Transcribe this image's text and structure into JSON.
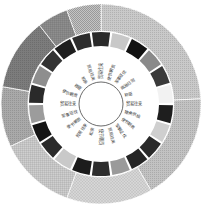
{
  "diagram": {
    "type": "circular-sunburst",
    "center": [
      101,
      104
    ],
    "radii": {
      "inner_circle": 22,
      "label_ring_outer": 56,
      "middle_ring_inner": 58,
      "middle_ring_outer": 72,
      "outer_ring_inner": 73,
      "outer_ring_outer": 100
    },
    "outer_ring": [
      {
        "start": -90,
        "end": -3,
        "fill": "#c9c9c9",
        "pattern": "dots"
      },
      {
        "start": -3,
        "end": 60,
        "fill": "#c2c2c2",
        "pattern": "dots"
      },
      {
        "start": 60,
        "end": 110,
        "fill": "#d6d6d6",
        "pattern": "cross"
      },
      {
        "start": 110,
        "end": 155,
        "fill": "#cfcfcf",
        "pattern": "grid"
      },
      {
        "start": 155,
        "end": 190,
        "fill": "#a9a9a9",
        "pattern": "dots"
      },
      {
        "start": 190,
        "end": 232,
        "fill": "#7c7c7c",
        "pattern": "dots"
      },
      {
        "start": 232,
        "end": 250,
        "fill": "#8e8e8e",
        "pattern": "grid"
      },
      {
        "start": 250,
        "end": 270,
        "fill": "#c4c4c4",
        "pattern": "checker"
      }
    ],
    "middle_ring": [
      {
        "fill": "#2a2a2a"
      },
      {
        "fill": "#c8c8c8"
      },
      {
        "fill": "#111111"
      },
      {
        "fill": "#8a8a8a"
      },
      {
        "fill": "#3a3a3a"
      },
      {
        "fill": "#f2f2f2"
      },
      {
        "fill": "#1e1e1e"
      },
      {
        "fill": "#cfcfcf"
      },
      {
        "fill": "#2a2a2a"
      },
      {
        "fill": "#262626"
      },
      {
        "fill": "#9a9a9a"
      },
      {
        "fill": "#2e2e2e"
      },
      {
        "fill": "#1c1c1c"
      },
      {
        "fill": "#c9c9c9"
      },
      {
        "fill": "#2b2b2b"
      },
      {
        "fill": "#151515"
      },
      {
        "fill": "#9c9c9c"
      },
      {
        "fill": "#2a2a2a"
      },
      {
        "fill": "#8e8e8e"
      },
      {
        "fill": "#333333"
      },
      {
        "fill": "#1e1e1e"
      },
      {
        "fill": "#2d2d2d"
      }
    ],
    "labels": [
      "贸易往来",
      "使节朝贡",
      "军事征伐",
      "政治归附",
      "称臣",
      "贸易往来",
      "物资供给",
      "使节朝贡",
      "军事征伐",
      "贸易往来",
      "使节朝贡",
      "和亲",
      "贸易往来",
      "使节朝贡",
      "军事征伐",
      "贸易往来",
      "使节朝贡",
      "称臣",
      "和亲",
      "贸易往来"
    ]
  }
}
